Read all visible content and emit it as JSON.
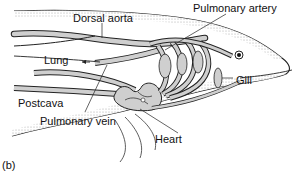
{
  "figure": {
    "panel_label": "(b)",
    "labels": {
      "dorsal_aorta": "Dorsal aorta",
      "pulmonary_artery": "Pulmonary artery",
      "lung": "Lung",
      "gill": "Gill",
      "postcava": "Postcava",
      "pulmonary_vein": "Pulmonary vein",
      "heart": "Heart"
    },
    "colors": {
      "vessel_fill": "#cfcfcf",
      "outline": "#222222",
      "stipple": "#bdbdbd",
      "background": "#ffffff"
    }
  }
}
